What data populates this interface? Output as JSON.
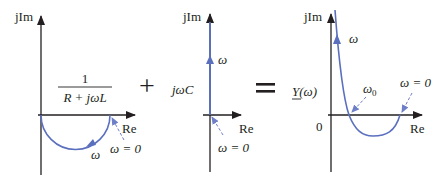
{
  "colors": {
    "axis": "#231f20",
    "curve": "#5b6fbf",
    "arrow_dashed": "#6f7fc7"
  },
  "panels": [
    {
      "id": "rl-admittance",
      "axis_y_label": "jIm",
      "axis_x_label": "Re",
      "expression_numerator": "1",
      "expression_denominator": "R + jωL",
      "omega_label": "ω",
      "omega_zero_label": "ω = 0"
    },
    {
      "id": "capacitor-admittance",
      "axis_y_label": "jIm",
      "axis_x_label": "Re",
      "expression": "jωC",
      "omega_label": "ω",
      "omega_zero_label": "ω = 0"
    },
    {
      "id": "total-admittance",
      "axis_y_label": "jIm",
      "axis_x_label": "Re",
      "expression": "Y(ω)",
      "origin_label": "0",
      "omega_label": "ω",
      "omega0_label": "ω",
      "omega0_subscript": "0",
      "omega_zero_label": "ω = 0"
    }
  ],
  "operators": {
    "plus": "+",
    "equals": "="
  }
}
